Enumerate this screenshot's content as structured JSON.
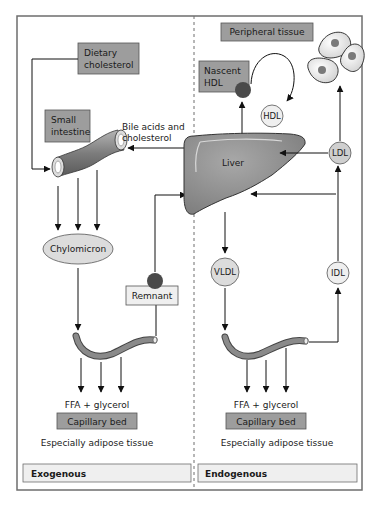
{
  "diagram": {
    "colors": {
      "frame": "#6e6e6e",
      "box_dark": "#9d9d9d",
      "box_light": "#efefef",
      "organ": "#8c8c8c",
      "particle_light": "#dcdcdc",
      "particle_dark": "#4a4a4a",
      "arrow": "#111111"
    },
    "exogenous": {
      "section_label": "Exogenous",
      "dietary_cholesterol": [
        "Dietary",
        "cholesterol"
      ],
      "small_intestine": [
        "Small",
        "intestine"
      ],
      "bile_acids": [
        "Bile acids and",
        "cholesterol"
      ],
      "chylomicron": "Chylomicron",
      "remnant": "Remnant",
      "ffa": "FFA + glycerol",
      "capillary_bed": "Capillary bed",
      "adipose": "Especially adipose tissue"
    },
    "endogenous": {
      "section_label": "Endogenous",
      "peripheral_tissue": "Peripheral tissue",
      "nascent_hdl": [
        "Nascent",
        "HDL"
      ],
      "hdl": "HDL",
      "liver": "Liver",
      "ldl": "LDL",
      "vldl": "VLDL",
      "idl": "IDL",
      "ffa": "FFA + glycerol",
      "capillary_bed": "Capillary bed",
      "adipose": "Especially adipose tissue"
    }
  }
}
